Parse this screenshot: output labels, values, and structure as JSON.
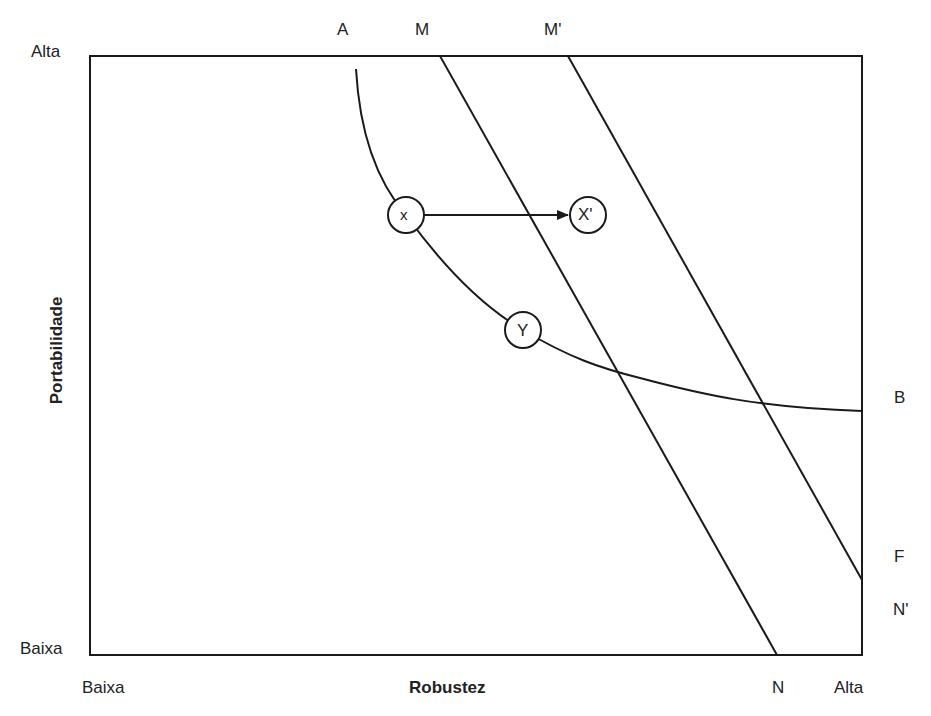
{
  "diagram": {
    "type": "conceptual-tradeoff-plot",
    "x_axis": {
      "title": "Robustez",
      "low_label": "Baixa",
      "high_label": "Alta"
    },
    "y_axis": {
      "title": "Portabilidade",
      "low_label": "Baixa",
      "high_label": "Alta"
    },
    "curve_labels": {
      "A": "A",
      "B": "B"
    },
    "line_labels": {
      "M": "M",
      "N": "N",
      "M_prime": "M'",
      "N_prime": "N'",
      "F": "F"
    },
    "nodes": [
      {
        "id": "x",
        "label": "x"
      },
      {
        "id": "x_prime",
        "label": "X'"
      },
      {
        "id": "y",
        "label": "Y"
      }
    ],
    "colors": {
      "stroke": "#1a1a1a",
      "background": "#ffffff"
    }
  }
}
